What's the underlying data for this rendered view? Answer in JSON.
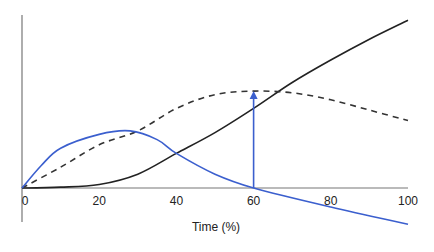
{
  "chart_data": {
    "type": "line",
    "title": "",
    "xlabel": "Time (%)",
    "ylabel": "",
    "xlim": [
      0,
      100
    ],
    "ylim": [
      -21,
      100
    ],
    "grid": false,
    "legend": null,
    "x_ticks": [
      "0",
      "20",
      "40",
      "60",
      "80",
      "100"
    ],
    "series": [
      {
        "name": "black-solid",
        "style": "solid",
        "color": "#222222",
        "x": [
          0,
          10,
          20,
          30,
          40,
          50,
          60,
          70,
          80,
          90,
          100
        ],
        "values": [
          0,
          0.5,
          2,
          8,
          20,
          32,
          46,
          61,
          74,
          86,
          97
        ]
      },
      {
        "name": "black-dashed",
        "style": "dashed",
        "color": "#333333",
        "x": [
          0,
          10,
          20,
          30,
          40,
          50,
          60,
          70,
          80,
          90,
          100
        ],
        "values": [
          0,
          12,
          25,
          33,
          46,
          54,
          56,
          55,
          51,
          45,
          39
        ]
      },
      {
        "name": "blue-solid",
        "style": "solid",
        "color": "#3b5fce",
        "x": [
          0,
          5,
          10,
          20,
          28,
          35,
          40,
          50,
          60,
          80,
          100
        ],
        "values": [
          0,
          13,
          23,
          31,
          33,
          28,
          20,
          8,
          0,
          -11,
          -21
        ]
      }
    ],
    "annotations": [
      {
        "type": "arrow",
        "color": "#3b5fce",
        "from": [
          60,
          0
        ],
        "to": [
          60,
          56
        ]
      }
    ]
  },
  "labels": {
    "x_axis_title": "Time (%)",
    "ticks": [
      "0",
      "20",
      "40",
      "60",
      "80",
      "100"
    ]
  }
}
